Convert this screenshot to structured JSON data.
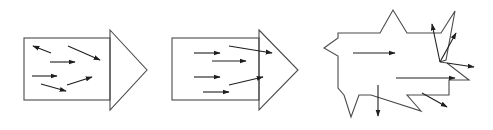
{
  "diagram": {
    "colors": {
      "outline": "#4a4a4a",
      "vector": "#1e1e1e",
      "background": "#ffffff"
    },
    "panels": [
      {
        "id": "panel-1",
        "shape": {
          "rect": {
            "x": 24,
            "y": 38,
            "w": 86,
            "h": 62
          },
          "head": "110,30 147,70 110,110"
        },
        "vectors": [
          {
            "x1": 51,
            "y1": 53,
            "x2": 33,
            "y2": 46
          },
          {
            "x1": 50,
            "y1": 62,
            "x2": 75,
            "y2": 62
          },
          {
            "x1": 68,
            "y1": 46,
            "x2": 100,
            "y2": 60
          },
          {
            "x1": 32,
            "y1": 76,
            "x2": 57,
            "y2": 76
          },
          {
            "x1": 41,
            "y1": 84,
            "x2": 66,
            "y2": 91
          },
          {
            "x1": 67,
            "y1": 85,
            "x2": 92,
            "y2": 77
          }
        ]
      },
      {
        "id": "panel-2",
        "shape": {
          "rect": {
            "x": 172,
            "y": 38,
            "w": 87,
            "h": 62
          },
          "head": "259,30 298,70 259,110"
        },
        "vectors": [
          {
            "x1": 194,
            "y1": 53,
            "x2": 220,
            "y2": 53
          },
          {
            "x1": 212,
            "y1": 61,
            "x2": 246,
            "y2": 61
          },
          {
            "x1": 229,
            "y1": 46,
            "x2": 272,
            "y2": 53
          },
          {
            "x1": 194,
            "y1": 77,
            "x2": 220,
            "y2": 77
          },
          {
            "x1": 229,
            "y1": 85,
            "x2": 263,
            "y2": 77
          },
          {
            "x1": 203,
            "y1": 92,
            "x2": 229,
            "y2": 92
          }
        ]
      },
      {
        "id": "panel-3",
        "shape": {
          "polygon": "338,33 380,33 393,10 407,33 441,33 455,11 446,60 440,62 447,63 469,80 449,80 449,95 407,95 421,111 371,95 359,95 351,117 344,95 338,88 338,56 324,48 338,38"
        },
        "vectors": [
          {
            "x1": 353,
            "y1": 53,
            "x2": 395,
            "y2": 53
          },
          {
            "x1": 396,
            "y1": 78,
            "x2": 455,
            "y2": 78
          },
          {
            "x1": 378,
            "y1": 85,
            "x2": 378,
            "y2": 116
          },
          {
            "x1": 422,
            "y1": 93,
            "x2": 447,
            "y2": 107
          },
          {
            "x1": 440,
            "y1": 62,
            "x2": 432,
            "y2": 24
          },
          {
            "x1": 440,
            "y1": 62,
            "x2": 456,
            "y2": 33
          },
          {
            "x1": 447,
            "y1": 63,
            "x2": 474,
            "y2": 67
          }
        ]
      }
    ]
  }
}
